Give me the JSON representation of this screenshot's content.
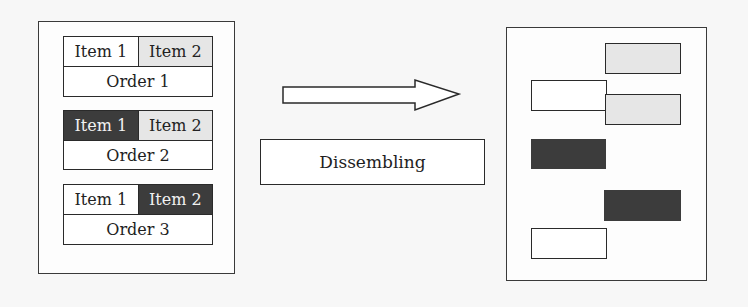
{
  "colors": {
    "white": "#ffffff",
    "light": "#e6e6e6",
    "dark": "#3c3c3c",
    "stroke": "#2a2a2a"
  },
  "left_panel": {
    "orders": [
      {
        "label": "Order 1",
        "item1": {
          "label": "Item 1",
          "fill": "white"
        },
        "item2": {
          "label": "Item 2",
          "fill": "light"
        }
      },
      {
        "label": "Order 2",
        "item1": {
          "label": "Item 1",
          "fill": "dark"
        },
        "item2": {
          "label": "Item 2",
          "fill": "light"
        }
      },
      {
        "label": "Order 3",
        "item1": {
          "label": "Item 1",
          "fill": "white"
        },
        "item2": {
          "label": "Item 2",
          "fill": "dark"
        }
      }
    ]
  },
  "process": {
    "arrow": "right-arrow",
    "label": "Dissembling"
  },
  "right_panel": {
    "pieces": [
      {
        "name": "light-piece-1",
        "fill": "light"
      },
      {
        "name": "white-piece-1",
        "fill": "white"
      },
      {
        "name": "light-piece-2",
        "fill": "light"
      },
      {
        "name": "dark-piece-1",
        "fill": "dark"
      },
      {
        "name": "dark-piece-2",
        "fill": "dark"
      },
      {
        "name": "white-piece-2",
        "fill": "white"
      }
    ]
  }
}
